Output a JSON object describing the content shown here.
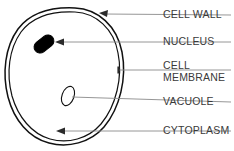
{
  "diagram": {
    "background_color": "#ffffff",
    "outline_color": "#111111",
    "leader_color": "#8a8a8a",
    "text_color": "#3a3a3a",
    "nucleus_color": "#000000"
  },
  "labels": {
    "cell_wall": "CELL WALL",
    "nucleus": "NUCLEUS",
    "cell_membrane_line1": "CELL",
    "cell_membrane_line2": "MEMBRANE",
    "vacuole": "VACUOLE",
    "cytoplasm": "CYTOPLASM"
  },
  "parts": [
    {
      "id": "cell-wall",
      "label": "CELL WALL",
      "label_x": 163,
      "label_y": 15,
      "leader_from_x": 231,
      "leader_from_y": 15,
      "leader_to_x": 100,
      "leader_to_y": 14,
      "pointer": "arrow"
    },
    {
      "id": "nucleus",
      "label": "NUCLEUS",
      "label_x": 163,
      "label_y": 42,
      "leader_from_x": 231,
      "leader_from_y": 42,
      "leader_to_x": 57,
      "leader_to_y": 42,
      "pointer": "arrow"
    },
    {
      "id": "cell-membrane",
      "label": "CELL MEMBRANE",
      "label_x": 163,
      "label_y": 66,
      "leader_from_x": 231,
      "leader_from_y": 70,
      "leader_to_x": 118,
      "leader_to_y": 70,
      "pointer": "tick"
    },
    {
      "id": "vacuole",
      "label": "VACUOLE",
      "label_x": 163,
      "label_y": 102,
      "leader_from_x": 231,
      "leader_from_y": 102,
      "leader_to_x": 72,
      "leader_to_y": 97,
      "pointer": "none"
    },
    {
      "id": "cytoplasm",
      "label": "CYTOPLASM",
      "label_x": 163,
      "label_y": 131,
      "leader_from_x": 231,
      "leader_from_y": 131,
      "leader_to_x": 57,
      "leader_to_y": 131,
      "pointer": "arrow"
    }
  ]
}
